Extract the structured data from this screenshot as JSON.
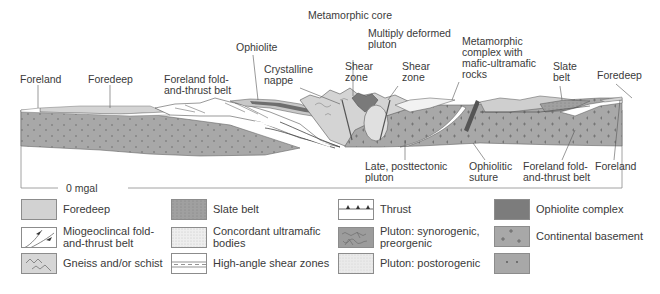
{
  "diagram": {
    "type": "geologic cross-section of an orogen",
    "top_labels": {
      "metamorphic_core": "Metamorphic core",
      "multiply_deformed_pluton": "Multiply deformed\npluton",
      "ophiolite": "Ophiolite",
      "crystalline_nappe": "Crystalline\nnappe",
      "shear_zone_left": "Shear\nzone",
      "shear_zone_right": "Shear\nzone",
      "metamorphic_complex": "Metamorphic\ncomplex with\nmafic-ultramafic\nrocks",
      "slate_belt": "Slate\nbelt",
      "foredeep_right": "Foredeep",
      "foreland_left": "Foreland",
      "foredeep_left": "Foredeep",
      "foreland_fold_left": "Foreland fold-\nand-thrust belt"
    },
    "bottom_labels": {
      "late_pluton": "Late, posttectonic\npluton",
      "ophiolitic_suture": "Ophiolitic\nsuture",
      "foreland_fold_right": "Foreland fold-\nand-thrust belt",
      "foreland_right": "Foreland"
    },
    "gravity_baseline": "0 mgal"
  },
  "legend": {
    "items": [
      {
        "id": "foredeep",
        "label": "Foredeep",
        "color": "#d2d2d2"
      },
      {
        "id": "miogeoclinal",
        "label": "Miogeoclincal fold-\nand-thrust belt",
        "color": "#ffffff"
      },
      {
        "id": "gneiss",
        "label": "Gneiss and/or schist",
        "color": "#d6d6d6"
      },
      {
        "id": "slate_belt",
        "label": "Slate belt",
        "color": "#a4a4a4"
      },
      {
        "id": "ultramafic",
        "label": "Concordant ultramafic\nbodies",
        "color": "#f0f0f0"
      },
      {
        "id": "shear_zones",
        "label": "High-angle shear zones",
        "color": "#ffffff"
      },
      {
        "id": "thrust",
        "label": "Thrust",
        "color": "#ffffff"
      },
      {
        "id": "pluton_syn",
        "label": "Pluton: synorogenic,\npreorgenic",
        "color": "#9c9c9c"
      },
      {
        "id": "pluton_post",
        "label": "Pluton: postorogenic",
        "color": "#e4e4e4"
      },
      {
        "id": "ophiolite_complex",
        "label": "Ophiolite complex",
        "color": "#7c7c7c"
      },
      {
        "id": "continental_basement",
        "label": "Continental basement",
        "color": "#a8a8a8"
      },
      {
        "id": "basement_other",
        "label": "",
        "color": "#a8a8a8"
      }
    ]
  },
  "colors": {
    "basement": "#a6a6a6",
    "foredeep": "#d4d4d4",
    "thrust_white": "#ffffff",
    "ophiolite": "#6e6e6e",
    "gneiss": "#cfcfcf",
    "line": "#555555"
  }
}
